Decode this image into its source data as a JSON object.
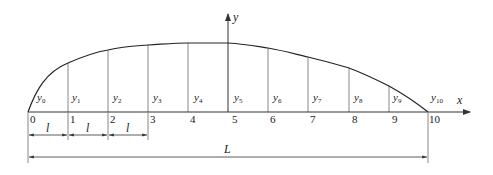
{
  "diagram": {
    "type": "trapezoid-rule-ordinates",
    "axes": {
      "x_label": "x",
      "y_label": "y"
    },
    "stations": [
      "0",
      "1",
      "2",
      "3",
      "4",
      "5",
      "6",
      "7",
      "8",
      "9",
      "10"
    ],
    "ordinates": [
      {
        "base": "y",
        "sub": "0"
      },
      {
        "base": "y",
        "sub": "1"
      },
      {
        "base": "y",
        "sub": "2"
      },
      {
        "base": "y",
        "sub": "3"
      },
      {
        "base": "y",
        "sub": "4"
      },
      {
        "base": "y",
        "sub": "5"
      },
      {
        "base": "y",
        "sub": "6"
      },
      {
        "base": "y",
        "sub": "7"
      },
      {
        "base": "y",
        "sub": "8"
      },
      {
        "base": "y",
        "sub": "9"
      },
      {
        "base": "y",
        "sub": "10"
      }
    ],
    "spacing_label": "l",
    "spacing_count_shown": 3,
    "total_length_label": "L",
    "colors": {
      "line": "#333333",
      "curve": "#222222",
      "grid": "#888888"
    }
  }
}
